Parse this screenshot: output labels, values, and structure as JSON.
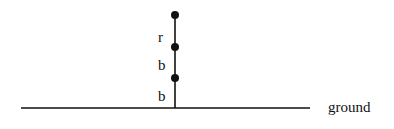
{
  "diagram": {
    "colors": {
      "stroke": "#111111",
      "background": "#ffffff"
    },
    "ground": {
      "label": "ground",
      "x1": 21,
      "x2": 310,
      "y": 108
    },
    "stack": {
      "x": 175,
      "top_y": 15,
      "nodes": [
        {
          "y": 15
        },
        {
          "y": 47
        },
        {
          "y": 78
        }
      ],
      "segments": [
        {
          "label": "r",
          "label_y": 42
        },
        {
          "label": "b",
          "label_y": 70
        },
        {
          "label": "b",
          "label_y": 101
        }
      ]
    }
  }
}
